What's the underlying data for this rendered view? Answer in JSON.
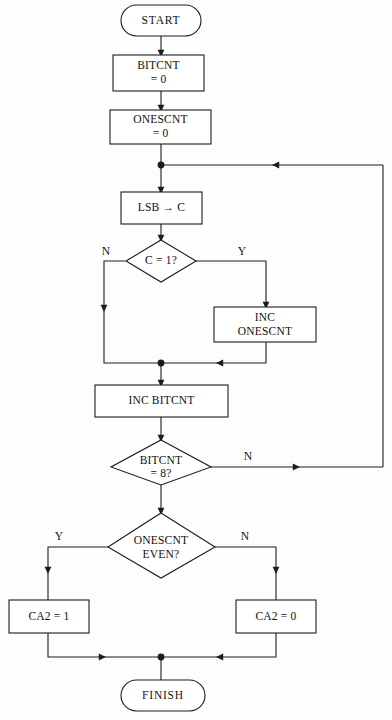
{
  "diagram": {
    "background_color": "#fdfdfd",
    "line_color": "#1c1c1c",
    "shape_fill": "#ffffff",
    "text_color": "#111111"
  },
  "nodes": {
    "start": {
      "label": "START",
      "shape": "terminator"
    },
    "bitcnt_init": {
      "line1": "BITCNT",
      "line2": "= 0",
      "shape": "process"
    },
    "onescnt_init": {
      "line1": "ONESCNT",
      "line2": "= 0",
      "shape": "process"
    },
    "lsb_to_c": {
      "label": "LSB → C",
      "shape": "process"
    },
    "c_eq_1": {
      "label": "C = 1?",
      "shape": "decision"
    },
    "inc_onescnt": {
      "line1": "INC",
      "line2": "ONESCNT",
      "shape": "process"
    },
    "inc_bitcnt": {
      "label": "INC BITCNT",
      "shape": "process"
    },
    "bitcnt_eq_8": {
      "line1": "BITCNT",
      "line2": "= 8?",
      "shape": "decision"
    },
    "onescnt_even": {
      "line1": "ONESCNT",
      "line2": "EVEN?",
      "shape": "decision"
    },
    "ca2_set": {
      "label": "CA2 = 1",
      "shape": "process"
    },
    "ca2_clear": {
      "label": "CA2 = 0",
      "shape": "process"
    },
    "finish": {
      "label": "FINISH",
      "shape": "terminator"
    }
  },
  "branch_labels": {
    "c_eq_1_no": "N",
    "c_eq_1_yes": "Y",
    "bitcnt_eq_8_no": "N",
    "onescnt_even_yes": "Y",
    "onescnt_even_no": "N"
  },
  "flow": {
    "edges": [
      {
        "from": "start",
        "to": "bitcnt_init",
        "label": ""
      },
      {
        "from": "bitcnt_init",
        "to": "onescnt_init",
        "label": ""
      },
      {
        "from": "onescnt_init",
        "to": "lsb_to_c",
        "label": ""
      },
      {
        "from": "lsb_to_c",
        "to": "c_eq_1",
        "label": ""
      },
      {
        "from": "c_eq_1",
        "to": "inc_onescnt",
        "label": "Y"
      },
      {
        "from": "c_eq_1",
        "to": "inc_bitcnt",
        "label": "N"
      },
      {
        "from": "inc_onescnt",
        "to": "inc_bitcnt",
        "label": ""
      },
      {
        "from": "inc_bitcnt",
        "to": "bitcnt_eq_8",
        "label": ""
      },
      {
        "from": "bitcnt_eq_8",
        "to": "lsb_to_c",
        "label": "N"
      },
      {
        "from": "bitcnt_eq_8",
        "to": "onescnt_even",
        "label": ""
      },
      {
        "from": "onescnt_even",
        "to": "ca2_set",
        "label": "Y"
      },
      {
        "from": "onescnt_even",
        "to": "ca2_clear",
        "label": "N"
      },
      {
        "from": "ca2_set",
        "to": "finish",
        "label": ""
      },
      {
        "from": "ca2_clear",
        "to": "finish",
        "label": ""
      }
    ]
  }
}
